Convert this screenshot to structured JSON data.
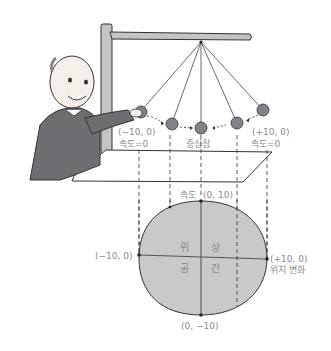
{
  "diagram": {
    "type": "pendulum-phase-space",
    "colors": {
      "ball": "#7f8286",
      "phase_fill": "#c9c9c9",
      "stand": "#c4c4c4",
      "suit": "#6e6e72",
      "label": "#8a8a8a",
      "line": "#333333"
    },
    "pendulum_labels": {
      "left_pos": "(−10, 0)",
      "left_speed": "속도=0",
      "center": "중심점",
      "right_pos": "(+10, 0)",
      "right_speed": "속도=0"
    },
    "phase_labels": {
      "top": "(0, 10)",
      "top_axis": "속도",
      "left": "(−10, 0)",
      "right": "(+10, 0)",
      "right_axis": "위치 변화",
      "bottom": "(0, −10)",
      "quad_tl": "위",
      "quad_tr": "상",
      "quad_bl": "공",
      "quad_br": "간"
    },
    "character": "elderly-man-pushing-pendulum"
  }
}
